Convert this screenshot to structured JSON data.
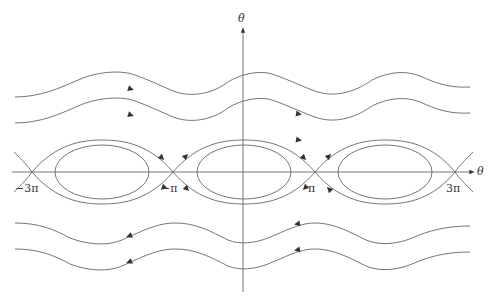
{
  "diagram": {
    "axes": {
      "x_label": "θ",
      "y_label": "θ̇"
    },
    "tick_labels": [
      {
        "id": "neg3pi",
        "label": "−3π",
        "x": 32
      },
      {
        "id": "negpi",
        "label": "−π",
        "x": 173
      },
      {
        "id": "pi",
        "label": "π",
        "x": 315
      },
      {
        "id": "3pi",
        "label": "3π",
        "x": 455
      }
    ],
    "saddle_points_x": [
      32,
      173,
      315,
      455
    ],
    "centers_x": [
      102,
      244,
      385
    ],
    "rotating_orbits": [
      {
        "y": 95,
        "direction": "right"
      },
      {
        "y": 121,
        "direction": "right"
      },
      {
        "y": 224,
        "direction": "left"
      },
      {
        "y": 250,
        "direction": "left"
      }
    ],
    "line_color": "#555555"
  }
}
